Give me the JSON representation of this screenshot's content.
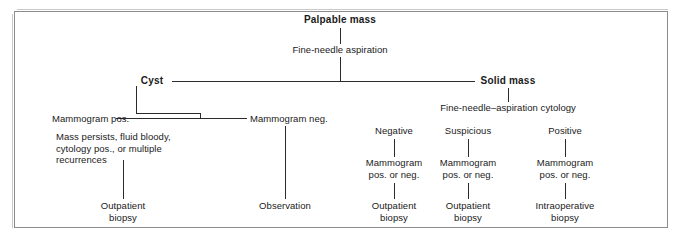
{
  "figure": {
    "border_color": "#8c8c8c",
    "line_color": "#2b2b2b",
    "text_color": "#1a1a1a"
  },
  "nodes": {
    "root": "Palpable mass",
    "root_procedure": "Fine-needle aspiration",
    "branch_cyst": "Cyst",
    "branch_solid": "Solid mass",
    "cyst_mammogram_pos": "Mammogram pos.",
    "cyst_mammogram_neg": "Mammogram neg.",
    "cyst_criteria_line1": "Mass persists, fluid bloody,",
    "cyst_criteria_line2": "cytology pos., or multiple",
    "cyst_criteria_line3": "recurrences",
    "cyst_outcome_line1": "Outpatient",
    "cyst_outcome_line2": "biopsy",
    "cyst_neg_outcome": "Observation",
    "solid_procedure": "Fine-needle–aspiration cytology",
    "solid_negative": "Negative",
    "solid_suspicious": "Suspicious",
    "solid_positive": "Positive",
    "negative_mammogram_line1": "Mammogram",
    "negative_mammogram_line2": "pos. or neg.",
    "suspicious_mammogram_line1": "Mammogram",
    "suspicious_mammogram_line2": "pos. or neg.",
    "positive_mammogram_line1": "Mammogram",
    "positive_mammogram_line2": "pos. or neg.",
    "negative_outcome_line1": "Outpatient",
    "negative_outcome_line2": "biopsy",
    "suspicious_outcome_line1": "Outpatient",
    "suspicious_outcome_line2": "biopsy",
    "positive_outcome_line1": "Intraoperative",
    "positive_outcome_line2": "biopsy"
  }
}
